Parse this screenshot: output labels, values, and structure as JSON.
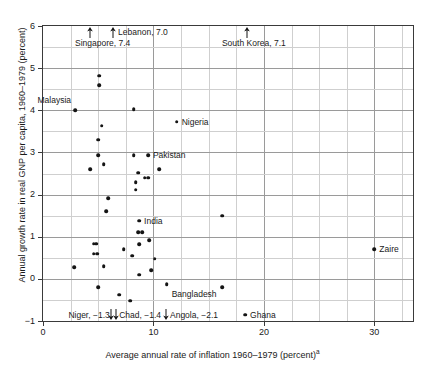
{
  "chart_data": {
    "type": "scatter",
    "title": "",
    "xlabel": "Average annual rate of inflation 1960–1979 (percent)",
    "xlabel_superscript": "a",
    "ylabel": "Annual growth rate in real GNP per capita, 1960–1979 (percent)",
    "xlim": [
      0,
      33.5
    ],
    "ylim": [
      -1,
      6
    ],
    "xticks": [
      0,
      10,
      20,
      30
    ],
    "xtick_labels": [
      "0",
      "10",
      "20",
      "30"
    ],
    "yticks": [
      -1,
      0,
      1,
      2,
      3,
      4,
      5,
      6
    ],
    "ytick_labels": [
      "−1",
      "0",
      "1",
      "2",
      "3",
      "4",
      "5",
      "6"
    ],
    "x_minor_step": 2.5,
    "y_minor_step": 0.5,
    "grid": true,
    "legend": "none",
    "points": [
      {
        "x": 5.1,
        "y": 4.82,
        "label": ""
      },
      {
        "x": 5.1,
        "y": 4.6,
        "label": ""
      },
      {
        "x": 2.9,
        "y": 4.0,
        "label": "Malaysia",
        "label_side": "left",
        "label_dy": -10
      },
      {
        "x": 8.2,
        "y": 4.02,
        "label": ""
      },
      {
        "x": 12.1,
        "y": 3.73,
        "label": "Nigeria",
        "label_side": "right"
      },
      {
        "x": 5.3,
        "y": 3.63,
        "label": ""
      },
      {
        "x": 5.0,
        "y": 3.3,
        "label": ""
      },
      {
        "x": 5.0,
        "y": 2.93,
        "label": ""
      },
      {
        "x": 8.2,
        "y": 2.93,
        "label": ""
      },
      {
        "x": 9.5,
        "y": 2.93,
        "label": "Pakistan",
        "label_side": "right"
      },
      {
        "x": 4.3,
        "y": 2.6,
        "label": ""
      },
      {
        "x": 5.5,
        "y": 2.72,
        "label": ""
      },
      {
        "x": 10.5,
        "y": 2.6,
        "label": ""
      },
      {
        "x": 8.6,
        "y": 2.52,
        "label": ""
      },
      {
        "x": 9.2,
        "y": 2.4,
        "label": ""
      },
      {
        "x": 9.5,
        "y": 2.4,
        "label": ""
      },
      {
        "x": 8.4,
        "y": 2.3,
        "label": ""
      },
      {
        "x": 8.4,
        "y": 2.12,
        "label": ""
      },
      {
        "x": 5.9,
        "y": 1.92,
        "label": ""
      },
      {
        "x": 5.7,
        "y": 1.6,
        "label": ""
      },
      {
        "x": 16.2,
        "y": 1.5,
        "label": ""
      },
      {
        "x": 8.7,
        "y": 1.38,
        "label": "India",
        "label_side": "right"
      },
      {
        "x": 8.6,
        "y": 1.11,
        "label": ""
      },
      {
        "x": 9.0,
        "y": 1.11,
        "label": ""
      },
      {
        "x": 4.6,
        "y": 0.83,
        "label": ""
      },
      {
        "x": 4.8,
        "y": 0.83,
        "label": ""
      },
      {
        "x": 7.3,
        "y": 0.7,
        "label": ""
      },
      {
        "x": 8.7,
        "y": 0.82,
        "label": ""
      },
      {
        "x": 9.6,
        "y": 0.92,
        "label": ""
      },
      {
        "x": 4.6,
        "y": 0.6,
        "label": ""
      },
      {
        "x": 4.9,
        "y": 0.6,
        "label": ""
      },
      {
        "x": 8.1,
        "y": 0.55,
        "label": ""
      },
      {
        "x": 10.1,
        "y": 0.48,
        "label": ""
      },
      {
        "x": 2.8,
        "y": 0.28,
        "label": ""
      },
      {
        "x": 5.5,
        "y": 0.3,
        "label": ""
      },
      {
        "x": 8.7,
        "y": 0.1,
        "label": ""
      },
      {
        "x": 9.8,
        "y": 0.2,
        "label": ""
      },
      {
        "x": 30.0,
        "y": 0.7,
        "label": "Zaire",
        "label_side": "right"
      },
      {
        "x": 5.0,
        "y": -0.2,
        "label": ""
      },
      {
        "x": 11.2,
        "y": -0.12,
        "label": "Bangladesh",
        "label_side": "right",
        "label_dy": 10
      },
      {
        "x": 16.2,
        "y": -0.2,
        "label": ""
      },
      {
        "x": 6.9,
        "y": -0.38,
        "label": ""
      },
      {
        "x": 7.9,
        "y": -0.52,
        "label": ""
      },
      {
        "x": 18.3,
        "y": -0.85,
        "label": "Ghana",
        "label_side": "right"
      }
    ],
    "off_scale_top": [
      {
        "x": 4.3,
        "label": "Singapore, 7.4",
        "label_x": 2.9,
        "label_y": 0.18
      },
      {
        "x": 6.3,
        "label": "Lebanon, 7.0",
        "label_x": 6.8,
        "label_y": 0.04
      },
      {
        "x": 18.5,
        "label": "South Korea, 7.1",
        "label_x": 16.2,
        "label_y": 0.18
      }
    ],
    "off_scale_bottom": [
      {
        "x": 6.2,
        "label": "Niger, −1.3",
        "label_x": 2.3,
        "label_align": "left"
      },
      {
        "x": 6.6,
        "label": "Chad, −1.4",
        "label_x": 6.9,
        "label_align": "left"
      },
      {
        "x": 11.1,
        "label": "Angola, −2.1",
        "label_x": 11.5,
        "label_align": "left"
      }
    ]
  }
}
